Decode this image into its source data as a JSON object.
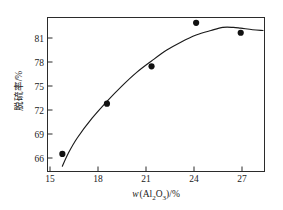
{
  "chart_data": {
    "type": "scatter",
    "title": "",
    "xlabel": "w(Al2O3)/%",
    "xlabel_parts": {
      "italic_symbol": "w",
      "open_paren": "(",
      "element_al": "Al",
      "sub_2": "2",
      "element_o": "O",
      "sub_3": "3",
      "close_paren": ")/%"
    },
    "ylabel": "脱硫率/%",
    "x": [
      15,
      18,
      21,
      24,
      27
    ],
    "values": [
      65.3,
      71.9,
      76.8,
      82.5,
      81.2
    ],
    "series": [
      {
        "name": "脱硫率",
        "x": [
          15,
          18,
          21,
          24,
          27
        ],
        "values": [
          65.3,
          71.9,
          76.8,
          82.5,
          81.2
        ]
      }
    ],
    "fit_curve": {
      "description": "smooth fitted trend line rising then flattening with slight decline",
      "points": [
        [
          15.0,
          63.7
        ],
        [
          15.4,
          65.4
        ],
        [
          16.0,
          67.4
        ],
        [
          17.0,
          70.0
        ],
        [
          18.0,
          72.2
        ],
        [
          19.0,
          74.2
        ],
        [
          20.0,
          76.0
        ],
        [
          21.0,
          77.5
        ],
        [
          22.0,
          78.9
        ],
        [
          23.0,
          80.0
        ],
        [
          24.0,
          80.9
        ],
        [
          25.0,
          81.5
        ],
        [
          25.8,
          81.9
        ],
        [
          26.5,
          81.9
        ],
        [
          27.0,
          81.8
        ],
        [
          27.8,
          81.6
        ],
        [
          28.5,
          81.5
        ]
      ]
    },
    "xticks": [
      15,
      18,
      21,
      24,
      27
    ],
    "yticks": [
      66,
      69,
      72,
      75,
      78,
      81
    ],
    "xlim": [
      14.0,
      28.6
    ],
    "ylim": [
      63.0,
      83.2
    ],
    "grid": false,
    "legend": null,
    "marker": "filled-circle",
    "marker_color": "#111111",
    "line_color": "#1a1a1a",
    "frame_color": "#2b2b2b",
    "background": "#ffffff"
  },
  "ticklabels": {
    "x": [
      "15",
      "18",
      "21",
      "24",
      "27"
    ],
    "y": [
      "66",
      "69",
      "72",
      "75",
      "78",
      "81"
    ]
  }
}
